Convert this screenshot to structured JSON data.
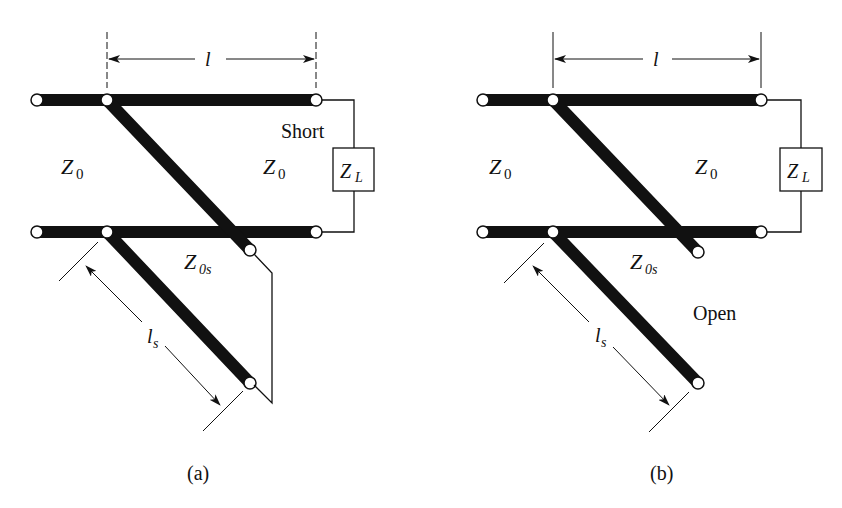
{
  "panels": [
    {
      "id": "a",
      "caption": "(a)",
      "length_label": "l",
      "stub_length_label": "l",
      "stub_length_sub": "s",
      "line_left_label": "Z",
      "line_left_sub": "0",
      "line_right_label": "Z",
      "line_right_sub": "0",
      "load_label": "Z",
      "load_sub": "L",
      "stub_impedance_label": "Z",
      "stub_impedance_sub": "0s",
      "termination_label": "Short"
    },
    {
      "id": "b",
      "caption": "(b)",
      "length_label": "l",
      "stub_length_label": "l",
      "stub_length_sub": "s",
      "line_left_label": "Z",
      "line_left_sub": "0",
      "line_right_label": "Z",
      "line_right_sub": "0",
      "load_label": "Z",
      "load_sub": "L",
      "stub_impedance_label": "Z",
      "stub_impedance_sub": "0s",
      "termination_label": "Open"
    }
  ],
  "colors": {
    "line": "#111111",
    "background": "#ffffff"
  }
}
